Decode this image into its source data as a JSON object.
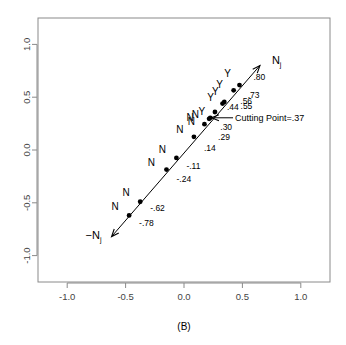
{
  "chart_data": {
    "type": "scatter",
    "title": "",
    "caption": "(B)",
    "xlabel": "",
    "ylabel": "",
    "xlim": [
      -1.25,
      1.25
    ],
    "ylim": [
      -1.25,
      1.25
    ],
    "grid": false,
    "legend": "none",
    "xticks": [
      "-1.0",
      "-0.5",
      "0.0",
      "0.5",
      "1.0"
    ],
    "xtick_values": [
      -1.0,
      -0.5,
      0.0,
      0.5,
      1.0
    ],
    "yticks": [
      "-1.0",
      "-0.5",
      "0.0",
      "0.5",
      "1.0"
    ],
    "ytick_values": [
      -1.0,
      -0.5,
      0.0,
      0.5,
      1.0
    ],
    "axis_line": {
      "name": "discriminant-axis",
      "from": [
        -0.62,
        -0.82
      ],
      "to": [
        0.65,
        0.8
      ],
      "arrow_start_label": "−N",
      "arrow_start_sub": "j",
      "arrow_end_label": "N",
      "arrow_end_sub": "j",
      "double_headed": true
    },
    "annotation": {
      "text": "Cutting Point=.37",
      "arrow_from": [
        0.42,
        0.305
      ],
      "arrow_to": [
        0.235,
        0.305
      ]
    },
    "points": [
      {
        "x": 0.475,
        "y": 0.615,
        "value": ".80",
        "class": "Y",
        "vx": 14,
        "vy": -5,
        "cx": -12,
        "cy": -8
      },
      {
        "x": 0.425,
        "y": 0.565,
        "value": ".73",
        "class": "Y",
        "vx": 14,
        "vy": 8,
        "cx": -14,
        "cy": -2
      },
      {
        "x": 0.345,
        "y": 0.455,
        "value": ".56",
        "class": "Y",
        "vx": 16,
        "vy": 2,
        "cx": -9,
        "cy": -7
      },
      {
        "x": 0.33,
        "y": 0.44,
        "value": ".55",
        "class": "Y",
        "vx": 18,
        "vy": 5,
        "cx": -12,
        "cy": -3
      },
      {
        "x": 0.265,
        "y": 0.36,
        "value": ".44",
        "class": "Y",
        "vx": 12,
        "vy": -2,
        "cx": -13,
        "cy": 3
      },
      {
        "x": 0.225,
        "y": 0.305,
        "value": ".30",
        "class": "N",
        "vx": 10,
        "vy": 12,
        "cx": -15,
        "cy": 0
      },
      {
        "x": 0.215,
        "y": 0.295,
        "value": ".29",
        "class": "N",
        "vx": 9,
        "vy": 21,
        "cx": -19,
        "cy": 2
      },
      {
        "x": 0.175,
        "y": 0.245,
        "value": "",
        "class": "N",
        "vx": 0,
        "vy": 0,
        "cx": -13,
        "cy": 1
      },
      {
        "x": 0.085,
        "y": 0.125,
        "value": ".14",
        "class": "N",
        "vx": 10,
        "vy": 14,
        "cx": -14,
        "cy": -4
      },
      {
        "x": -0.065,
        "y": -0.075,
        "value": "-.11",
        "class": "N",
        "vx": 10,
        "vy": 11,
        "cx": -14,
        "cy": -5
      },
      {
        "x": -0.15,
        "y": -0.185,
        "value": "-.24",
        "class": "N",
        "vx": 10,
        "vy": 12,
        "cx": -15,
        "cy": -4
      },
      {
        "x": -0.375,
        "y": -0.49,
        "value": "-.62",
        "class": "N",
        "vx": 10,
        "vy": 9,
        "cx": -14,
        "cy": -6
      },
      {
        "x": -0.47,
        "y": -0.62,
        "value": "-.78",
        "class": "N",
        "vx": 10,
        "vy": 11,
        "cx": -14,
        "cy": -5
      }
    ]
  }
}
